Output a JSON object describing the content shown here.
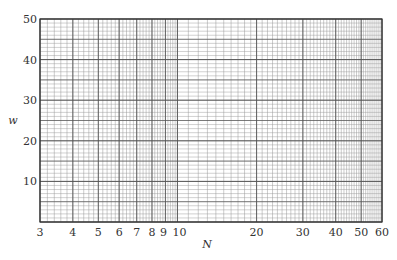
{
  "chart_data": {
    "type": "line",
    "title": "",
    "xlabel": "N",
    "ylabel": "w",
    "xscale": "log",
    "yscale": "linear",
    "xlim": [
      3,
      60
    ],
    "ylim": [
      0,
      50
    ],
    "x_ticks": [
      3,
      4,
      5,
      6,
      7,
      8,
      9,
      10,
      20,
      30,
      40,
      50,
      60
    ],
    "x_tick_labels": [
      "3",
      "4",
      "5",
      "6",
      "7",
      "8",
      "9",
      "10",
      "20",
      "30",
      "40",
      "50",
      "60"
    ],
    "y_ticks": [
      10,
      20,
      30,
      40,
      50
    ],
    "y_tick_labels": [
      "10",
      "20",
      "30",
      "40",
      "50"
    ],
    "grid": true,
    "series": [],
    "legend": null
  },
  "colors": {
    "major_grid": "#555555",
    "minor_grid": "#999999",
    "frame": "#333333",
    "background": "#ffffff"
  }
}
